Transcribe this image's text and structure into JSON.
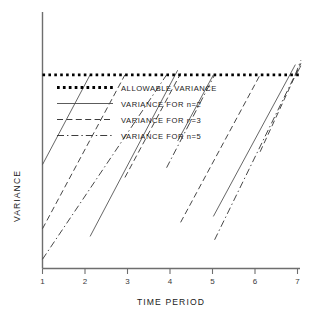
{
  "chart_data": {
    "type": "line",
    "title": "",
    "xlabel": "TIME PERIOD",
    "ylabel": "VARIANCE",
    "xlim": [
      1,
      7
    ],
    "ylim": [
      0,
      1
    ],
    "xticks": [
      "1",
      "2",
      "3",
      "4",
      "5",
      "6",
      "7"
    ],
    "yticks": [],
    "grid": false,
    "legend_position": "upper-center",
    "annotations": [],
    "threshold": {
      "label": "ALLOWABLE VARIANCE",
      "value": 0.755,
      "style": "dotted",
      "color": "#000000",
      "x_start": 1.0,
      "x_end": 7.05
    },
    "series": [
      {
        "name": "VARIANCE FOR n=2",
        "style": "solid",
        "color": "#4a4a4a",
        "description": "Sawtooth: variance accumulates linearly then resets after exceeding the allowable variance.",
        "segments": [
          {
            "x": [
              1.0,
              2.12
            ],
            "y": [
              0.405,
              0.755
            ]
          },
          {
            "x": [
              2.12,
              4.18
            ],
            "y": [
              0.125,
              0.773
            ]
          },
          {
            "x": [
              4.18,
              5.02
            ],
            "y": [
              0.497,
              0.755
            ]
          },
          {
            "x": [
              5.02,
              6.95
            ],
            "y": [
              0.203,
              0.795
            ]
          },
          {
            "x": [
              6.95,
              7.08
            ],
            "y": [
              0.75,
              0.79
            ]
          }
        ]
      },
      {
        "name": "VARIANCE FOR n=3",
        "style": "dashed",
        "color": "#3d3d3d",
        "description": "Sawtooth with shallower slope than n=2; crosses threshold later in each cycle.",
        "segments": [
          {
            "x": [
              1.0,
              2.94
            ],
            "y": [
              0.155,
              0.755
            ]
          },
          {
            "x": [
              2.94,
              4.25
            ],
            "y": [
              0.355,
              0.76
            ]
          },
          {
            "x": [
              4.25,
              6.12
            ],
            "y": [
              0.18,
              0.755
            ]
          },
          {
            "x": [
              6.12,
              7.08
            ],
            "y": [
              0.455,
              0.8
            ]
          }
        ]
      },
      {
        "name": "VARIANCE FOR n=5",
        "style": "dash-dot",
        "color": "#3d3d3d",
        "description": "Sawtooth with the shallowest slope; longest interval between threshold crossings.",
        "segments": [
          {
            "x": [
              1.0,
              3.92
            ],
            "y": [
              0.036,
              0.755
            ]
          },
          {
            "x": [
              3.92,
              5.05
            ],
            "y": [
              0.393,
              0.755
            ]
          },
          {
            "x": [
              5.05,
              6.95
            ],
            "y": [
              0.112,
              0.757
            ]
          },
          {
            "x": [
              6.95,
              7.08
            ],
            "y": [
              0.757,
              0.812
            ]
          }
        ]
      }
    ],
    "legend": [
      {
        "label": "ALLOWABLE VARIANCE",
        "style": "dotted"
      },
      {
        "label": "VARIANCE FOR n=2",
        "style": "solid"
      },
      {
        "label": "VARIANCE FOR n=3",
        "style": "dashed"
      },
      {
        "label": "VARIANCE FOR n=5",
        "style": "dash-dot"
      }
    ]
  }
}
